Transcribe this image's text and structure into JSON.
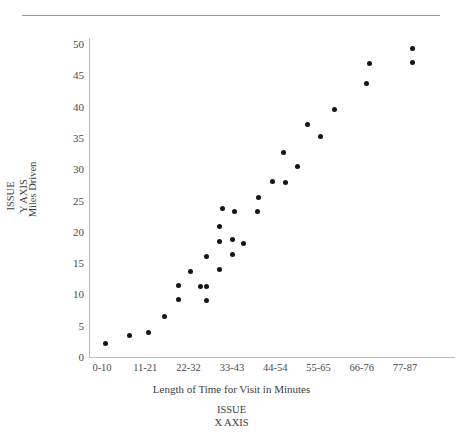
{
  "chart_data": {
    "type": "scatter",
    "title": "",
    "xlabel": "Length of Time for Visit in Minutes",
    "ylabel": "Miles Driven",
    "x_axis_annotation": "ISSUE\nX  AXIS",
    "y_axis_annotation": "ISSUE\nY  AXIS",
    "categories": [
      "0-10",
      "11-21",
      "22-32",
      "33-43",
      "44-54",
      "55-65",
      "66-76",
      "77-87"
    ],
    "xtick_labels": [
      "0-10",
      "11-21",
      "22-32",
      "33-43",
      "44-54",
      "55-65",
      "66-76",
      "77-87"
    ],
    "ytick_labels": [
      "0",
      "5",
      "10",
      "15",
      "20",
      "25",
      "30",
      "35",
      "40",
      "45",
      "50"
    ],
    "ylim": [
      0,
      50
    ],
    "ytick_step": 5,
    "grid": false,
    "legend": false,
    "marker_color": "#151515",
    "axis_color": "#bdbdbd",
    "n_points": 31,
    "points": [
      {
        "x_px": 105,
        "y": 2.2
      },
      {
        "x_px": 129,
        "y": 3.4
      },
      {
        "x_px": 148,
        "y": 3.9
      },
      {
        "x_px": 164,
        "y": 6.5
      },
      {
        "x_px": 178,
        "y": 11.4
      },
      {
        "x_px": 178,
        "y": 9.2
      },
      {
        "x_px": 190,
        "y": 13.6
      },
      {
        "x_px": 200,
        "y": 11.3
      },
      {
        "x_px": 206,
        "y": 16.1
      },
      {
        "x_px": 206,
        "y": 11.2
      },
      {
        "x_px": 206,
        "y": 9.0
      },
      {
        "x_px": 219,
        "y": 20.9
      },
      {
        "x_px": 219,
        "y": 18.5
      },
      {
        "x_px": 219,
        "y": 14.0
      },
      {
        "x_px": 222,
        "y": 23.8
      },
      {
        "x_px": 232,
        "y": 18.8
      },
      {
        "x_px": 232,
        "y": 16.3
      },
      {
        "x_px": 234,
        "y": 23.3
      },
      {
        "x_px": 243,
        "y": 18.1
      },
      {
        "x_px": 257,
        "y": 23.2
      },
      {
        "x_px": 258,
        "y": 25.5
      },
      {
        "x_px": 272,
        "y": 28.0
      },
      {
        "x_px": 285,
        "y": 27.9
      },
      {
        "x_px": 283,
        "y": 32.7
      },
      {
        "x_px": 297,
        "y": 30.4
      },
      {
        "x_px": 307,
        "y": 37.2
      },
      {
        "x_px": 320,
        "y": 35.2
      },
      {
        "x_px": 334,
        "y": 39.6
      },
      {
        "x_px": 366,
        "y": 43.7
      },
      {
        "x_px": 369,
        "y": 46.9
      },
      {
        "x_px": 412,
        "y": 49.3
      },
      {
        "x_px": 412,
        "y": 47.0
      }
    ]
  }
}
